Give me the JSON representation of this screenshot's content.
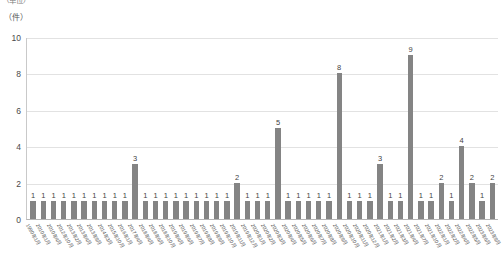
{
  "header": {
    "clipped_title": "（単位）",
    "unit_label": "（件）"
  },
  "chart_data": {
    "type": "bar",
    "title": "",
    "xlabel": "",
    "ylabel": "（件）",
    "ylim": [
      0,
      10
    ],
    "yticks": [
      0,
      2,
      4,
      6,
      8,
      10
    ],
    "grid": true,
    "legend": "none",
    "bar_color": "#848484",
    "gridline_color": "#e2e2e2",
    "axis_color": "#b5b5b5",
    "show_value_labels": true,
    "categories": [
      "1990年1月",
      "2010年1月",
      "2010年4月",
      "2012年10月",
      "2013年2月",
      "2013年4月",
      "2013年9月",
      "2014年3月",
      "2015年10月",
      "2016年1月",
      "2017年4月",
      "2018年4月",
      "2018年6月",
      "2018年10月",
      "2019年4月",
      "2019年6月",
      "2019年7月",
      "2019年8月",
      "2019年9月",
      "2019年10月",
      "2019年11月",
      "2019年12月",
      "2020年1月",
      "2020年2月",
      "2020年3月",
      "2020年4月",
      "2020年5月",
      "2020年6月",
      "2020年7月",
      "2020年8月",
      "2020年9月",
      "2020年10月",
      "2020年11月",
      "2020年12月",
      "2021年1月",
      "2021年2月",
      "2021年3月",
      "2021年4月",
      "2021年7月",
      "2021年10月",
      "2022年1月",
      "2022年2月",
      "2022年4月",
      "2022年5月",
      "2023年6月",
      "2023年9月"
    ],
    "values": [
      1,
      1,
      1,
      1,
      1,
      1,
      1,
      1,
      1,
      1,
      3,
      1,
      1,
      1,
      1,
      1,
      1,
      1,
      1,
      1,
      2,
      1,
      1,
      1,
      5,
      1,
      1,
      1,
      1,
      1,
      8,
      1,
      1,
      1,
      3,
      1,
      1,
      9,
      1,
      1,
      2,
      1,
      4,
      2,
      1,
      2
    ]
  }
}
